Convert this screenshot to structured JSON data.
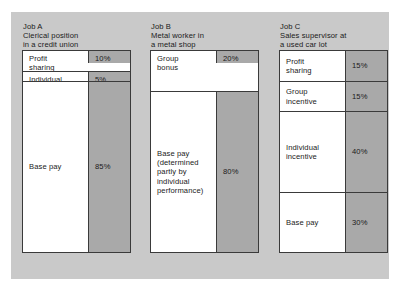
{
  "figure": {
    "background_color": "#c9c9c9",
    "bar_fill_color": "#a9a9a9",
    "label_fill_color": "#ffffff",
    "outline_color": "#3a3a3a"
  },
  "chart_data": {
    "type": "bar",
    "title": "",
    "xlabel": "",
    "ylabel": "",
    "ylim": [
      0,
      100
    ],
    "orientation": "vertical-stacked",
    "categories": [
      "Job A",
      "Job B",
      "Job C"
    ],
    "series": [
      {
        "name": "Job A",
        "job_id": "Job A",
        "job_description": "Clerical position\nin a credit union",
        "segments": [
          {
            "label": "Profit\nsharing",
            "value": 10,
            "value_label": "10%",
            "align": "top"
          },
          {
            "label": "Individual\nincentive",
            "value": 5,
            "value_label": "5%",
            "align": "top"
          },
          {
            "label": "Base pay",
            "value": 85,
            "value_label": "85%",
            "align": "center"
          }
        ]
      },
      {
        "name": "Job B",
        "job_id": "Job B",
        "job_description": "Metal worker in\na metal shop",
        "segments": [
          {
            "label": "Group\nbonus",
            "value": 20,
            "value_label": "20%",
            "align": "top"
          },
          {
            "label": "Base pay\n(determined\npartly by\nindividual\nperformance)",
            "value": 80,
            "value_label": "80%",
            "align": "center"
          }
        ]
      },
      {
        "name": "Job C",
        "job_id": "Job C",
        "job_description": "Sales supervisor at\na used car lot",
        "segments": [
          {
            "label": "Profit\nsharing",
            "value": 15,
            "value_label": "15%",
            "align": "center"
          },
          {
            "label": "Group\nincentive",
            "value": 15,
            "value_label": "15%",
            "align": "center"
          },
          {
            "label": "Individual\nincentive",
            "value": 40,
            "value_label": "40%",
            "align": "center"
          },
          {
            "label": "Base pay",
            "value": 30,
            "value_label": "30%",
            "align": "center"
          }
        ]
      }
    ]
  }
}
